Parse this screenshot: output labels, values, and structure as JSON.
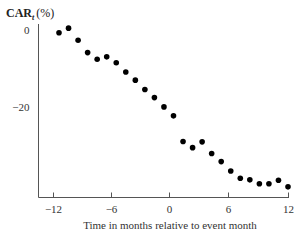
{
  "chart_data": {
    "type": "scatter",
    "title": "",
    "ylabel": "CAR",
    "ylabel_subscript": "t",
    "ylabel_unit": "(%)",
    "xlabel": "Time in months relative to event month",
    "xlim": [
      -12,
      12
    ],
    "ylim": [
      -43,
      0
    ],
    "x_ticks": [
      -12,
      -6,
      0,
      6,
      12
    ],
    "x_tick_labels": [
      "−12",
      "−6",
      "0",
      "6",
      "12"
    ],
    "y_ticks": [
      0,
      -20
    ],
    "y_tick_labels": [
      "0",
      "−20"
    ],
    "grid": false,
    "legend": "none",
    "series": [
      {
        "name": "CAR",
        "x": [
          -12,
          -11,
          -10,
          -9,
          -8,
          -7,
          -6,
          -5,
          -4,
          -3,
          -2,
          -1,
          0,
          1,
          2,
          3,
          4,
          5,
          6,
          7,
          8,
          9,
          10,
          11,
          12
        ],
        "y": [
          -0.8,
          0.4,
          -2.7,
          -5.9,
          -7.6,
          -7.0,
          -8.5,
          -10.9,
          -13.0,
          -15.4,
          -17.5,
          -19.9,
          -22.2,
          -28.8,
          -30.4,
          -28.9,
          -31.9,
          -34.0,
          -36.4,
          -38.3,
          -38.7,
          -39.7,
          -39.7,
          -38.8,
          -40.5
        ]
      }
    ]
  }
}
